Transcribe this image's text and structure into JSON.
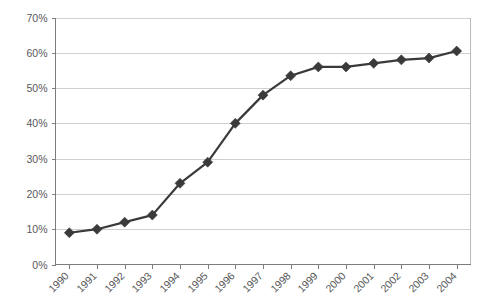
{
  "chart_data": {
    "type": "line",
    "title": "",
    "subtitle": "",
    "xlabel": "",
    "ylabel": "",
    "categories": [
      "1990",
      "1991",
      "1992",
      "1993",
      "1994",
      "1995",
      "1996",
      "1997",
      "1998",
      "1999",
      "2000",
      "2001",
      "2002",
      "2003",
      "2004"
    ],
    "values": [
      9,
      10,
      12,
      14,
      23,
      29,
      40,
      48,
      53.5,
      56,
      56,
      57,
      58,
      58.5,
      60.5
    ],
    "series": [
      {
        "name": "",
        "values": [
          9,
          10,
          12,
          14,
          23,
          29,
          40,
          48,
          53.5,
          56,
          56,
          57,
          58,
          58.5,
          60.5
        ]
      }
    ],
    "ylim": [
      0,
      70
    ],
    "ytick_values": [
      0,
      10,
      20,
      30,
      40,
      50,
      60,
      70
    ],
    "ytick_labels": [
      "0%",
      "10%",
      "20%",
      "30%",
      "40%",
      "50%",
      "60%",
      "70%"
    ],
    "xtick_labels": [
      "1990",
      "1991",
      "1992",
      "1993",
      "1994",
      "1995",
      "1996",
      "1997",
      "1998",
      "1999",
      "2000",
      "2001",
      "2002",
      "2003",
      "2004"
    ],
    "xtick_rotation": -45,
    "grid": "horizontal",
    "legend": "none",
    "marker": "diamond",
    "marker_color": "#3a3a3a",
    "line_color": "#3a3a3a",
    "gridline_color": "#cfcfcf",
    "axis_color": "#7d7d7d",
    "background_color": "#ffffff",
    "annotations": []
  }
}
